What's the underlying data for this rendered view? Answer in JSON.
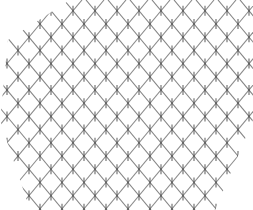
{
  "image": {
    "description": "Pencil drawing of a crosshatched diamond lattice with small vertical tick marks at intersections",
    "background": "#ffffff",
    "stroke_color": "#6a6a6a",
    "tick_color": "#3a3a3a",
    "width": 253,
    "height": 210
  },
  "lattice": {
    "spacing": 22,
    "slope": 1.2,
    "row_height": 26,
    "clip_polygon": "8,40 70,0 253,0 253,120 215,210 30,210 0,120"
  }
}
